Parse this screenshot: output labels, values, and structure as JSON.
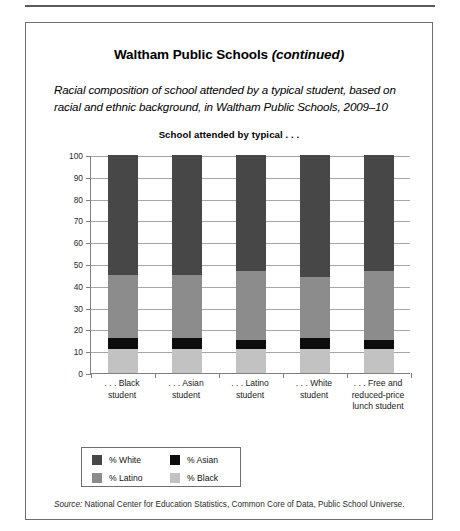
{
  "page": {
    "title_main": "Waltham Public Schools ",
    "title_continued": "(continued)",
    "subtitle": "Racial composition of school attended by a typical student, based on racial and ethnic background, in Waltham Public Schools, 2009–10",
    "source_prefix": "Source:",
    "source_text": " National Center for Education Statistics, Common Core of Data, Public School Universe."
  },
  "chart_data": {
    "type": "bar",
    "subtype": "stacked-bar-100",
    "title": "School attended by typical . . .",
    "xlabel": "",
    "ylabel": "",
    "ylim": [
      0,
      100
    ],
    "ytick_step": 10,
    "grid": true,
    "legend_position": "bottom-left",
    "yticks": [
      "0",
      "10",
      "20",
      "30",
      "40",
      "50",
      "60",
      "70",
      "80",
      "90",
      "100"
    ],
    "categories": [
      ". . . Black\nstudent",
      ". . . Asian\nstudent",
      ". . . Latino\nstudent",
      ". . . White\nstudent",
      ". . . Free and\nreduced-price\nlunch student"
    ],
    "category_lines": [
      [
        ". . . Black",
        "student"
      ],
      [
        ". . . Asian",
        "student"
      ],
      [
        ". . . Latino",
        "student"
      ],
      [
        ". . . White",
        "student"
      ],
      [
        ". . . Free and",
        "reduced-price",
        "lunch student"
      ]
    ],
    "series": [
      {
        "name": "% Black",
        "color": "#c2c2c2",
        "values": [
          11,
          11,
          11,
          11,
          11
        ]
      },
      {
        "name": "% Asian",
        "color": "#0d0d0d",
        "values": [
          5,
          5,
          4,
          5,
          4
        ]
      },
      {
        "name": "% Latino",
        "color": "#8c8c8c",
        "values": [
          29,
          29,
          32,
          28,
          32
        ]
      },
      {
        "name": "% White",
        "color": "#474747",
        "values": [
          55,
          55,
          53,
          56,
          53
        ]
      }
    ],
    "cumulative_tops": [
      [
        11,
        16,
        45,
        100
      ],
      [
        11,
        16,
        45,
        100
      ],
      [
        11,
        15,
        47,
        100
      ],
      [
        11,
        16,
        44,
        100
      ],
      [
        11,
        15,
        47,
        100
      ]
    ],
    "legend": [
      {
        "label": "% White",
        "color": "#474747"
      },
      {
        "label": "% Asian",
        "color": "#0d0d0d"
      },
      {
        "label": "% Latino",
        "color": "#8c8c8c"
      },
      {
        "label": "% Black",
        "color": "#c2c2c2"
      }
    ]
  }
}
